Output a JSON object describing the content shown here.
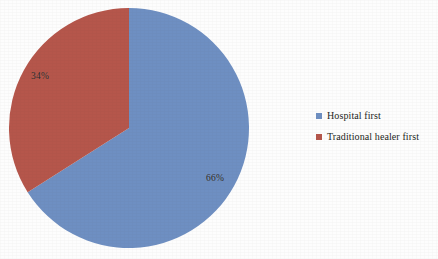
{
  "chart_data": {
    "type": "pie",
    "title": "",
    "subtitle": "",
    "xlabel": "",
    "ylabel": "",
    "grid": false,
    "legend_position": "right",
    "start_angle_deg": 0,
    "direction": "clockwise",
    "categories": [
      "Hospital first",
      "Traditional healer first"
    ],
    "values": [
      66,
      34
    ],
    "value_unit": "%",
    "data_labels": [
      "66%",
      "34%"
    ],
    "colors": [
      "#6e8fc2",
      "#b5564b"
    ],
    "slices": [
      {
        "label": "Hospital first",
        "value": 66,
        "data_label": "66%",
        "color": "#6e8fc2"
      },
      {
        "label": "Traditional healer first",
        "value": 34,
        "data_label": "34%",
        "color": "#b5564b"
      }
    ]
  },
  "legend": {
    "items": [
      {
        "label": "Hospital first",
        "color": "#6e8fc2",
        "swatch": "square-swatch"
      },
      {
        "label": "Traditional healer first",
        "color": "#b5564b",
        "swatch": "square-swatch"
      }
    ]
  },
  "canvas": {
    "background": "#fdfdfd"
  }
}
